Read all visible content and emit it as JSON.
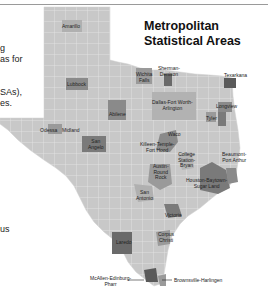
{
  "title": {
    "line1": "Metropolitan",
    "line2": "Statistical Areas"
  },
  "side_text": [
    {
      "text": "g",
      "top": 43
    },
    {
      "text": "as for",
      "top": 54
    },
    {
      "text": "SAs),",
      "top": 87
    },
    {
      "text": "es.",
      "top": 98
    },
    {
      "text": "us",
      "top": 224
    }
  ],
  "colors": {
    "county_fill": "#c8c8c8",
    "county_border": "#e6e6e6",
    "msa_dark": "#7a7a7a",
    "msa_medium": "#9a9a9a",
    "msa_darkest": "#5a5a5a",
    "text": "#222222"
  },
  "msa_labels": {
    "amarillo": "Amarillo",
    "lubbock": "Lubbock",
    "wichita_falls_1": "Wichita",
    "wichita_falls_2": "Falls",
    "sherman_1": "Sherman-",
    "sherman_2": "Denison",
    "texarkana": "Texarkana",
    "dallas_1": "Dallas-Fort Worth-",
    "dallas_2": "Arlington",
    "longview": "Longview",
    "tyler": "Tyler",
    "abilene": "Abilene",
    "odessa": "Odessa",
    "midland": "Midland",
    "san_angelo_1": "San",
    "san_angelo_2": "Angelo",
    "waco": "Waco",
    "killeen_1": "Killeen-Temple-",
    "killeen_2": "Fort Hood",
    "college_station_1": "College",
    "college_station_2": "Station-",
    "college_station_3": "Bryan",
    "beaumont_1": "Beaumont-",
    "beaumont_2": "Port Arthur",
    "austin_1": "Austin-",
    "austin_2": "Round",
    "austin_3": "Rock",
    "houston_1": "Houston-Baytown-",
    "houston_2": "Sugar Land",
    "san_antonio_1": "San",
    "san_antonio_2": "Antonio",
    "victoria": "Victoria",
    "corpus_christi_1": "Corpus",
    "corpus_christi_2": "Christi",
    "laredo": "Laredo",
    "mcallen_1": "McAllen-Edinburg-",
    "mcallen_2": "Pharr",
    "brownsville": "Brownsville-Harlingen"
  }
}
